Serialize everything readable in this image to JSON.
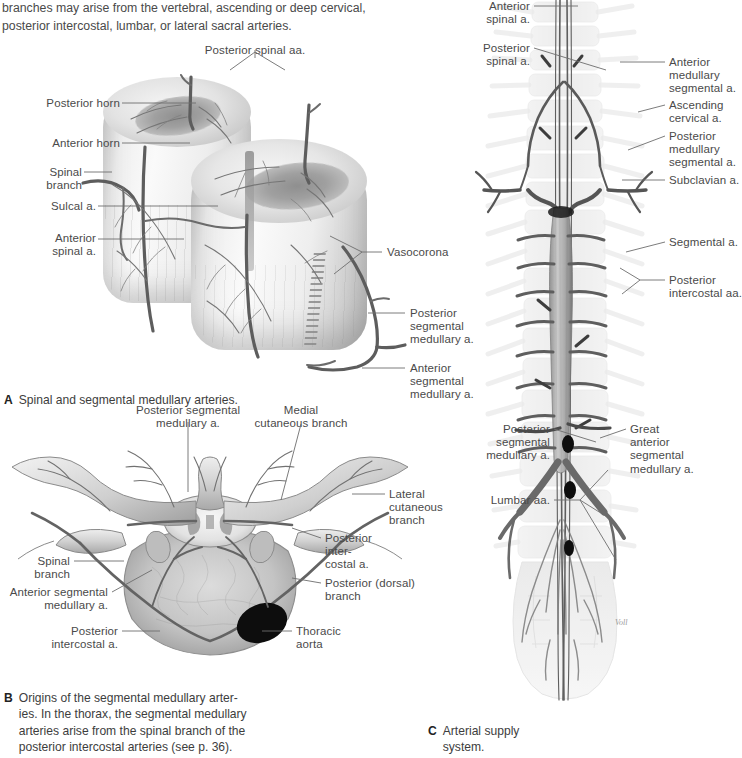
{
  "page": {
    "intro_text": "branches may arise from the vertebral, ascending or deep cervical,\nposterior intercostal, lumbar, or lateral sacral arteries."
  },
  "figure_a": {
    "letter": "A",
    "caption": "Spinal and segmental medullary arteries.",
    "labels": {
      "posterior_spinal_aa": "Posterior spinal aa.",
      "posterior_horn": "Posterior horn",
      "anterior_horn": "Anterior horn",
      "spinal_branch": "Spinal\nbranch",
      "sulcal_a": "Sulcal a.",
      "anterior_spinal_a": "Anterior\nspinal a.",
      "vasocorona": "Vasocorona",
      "posterior_segmental_medullary_a": "Posterior\nsegmental\nmedullary a.",
      "anterior_segmental_medullary_a": "Anterior\nsegmental\nmedullary a."
    }
  },
  "figure_b": {
    "letter": "B",
    "caption": "Origins of the segmental medullary arter-\nies. In the thorax, the segmental medullary\narteries arise from the spinal branch of the\nposterior intercostal arteries (see p. 36).",
    "labels": {
      "posterior_segmental_medullary_a": "Posterior segmental\nmedullary a.",
      "medial_cutaneous_branch": "Medial\ncutaneous branch",
      "lateral_cutaneous_branch": "Lateral\ncutaneous\nbranch",
      "posterior_intercostal_a": "Posterior\ninter-\ncostal a.",
      "posterior_dorsal_branch": "Posterior (dorsal)\nbranch",
      "spinal_branch": "Spinal\nbranch",
      "anterior_segmental_medullary_a": "Anterior segmental\nmedullary a.",
      "posterior_intercostal_a_left": "Posterior\nintercostal a.",
      "thoracic_aorta": "Thoracic\naorta"
    }
  },
  "figure_c": {
    "letter": "C",
    "caption": "Arterial supply\nsystem.",
    "labels": {
      "anterior_spinal_a": "Anterior\nspinal a.",
      "posterior_spinal_a": "Posterior\nspinal a.",
      "anterior_medullary_segmental_a": "Anterior\nmedullary\nsegmental a.",
      "ascending_cervical_a": "Ascending\ncervical a.",
      "posterior_medullary_segmental_a": "Posterior\nmedullary\nsegmental a.",
      "subclavian_a": "Subclavian a.",
      "segmental_a": "Segmental a.",
      "posterior_intercostal_aa": "Posterior\nintercostal aa.",
      "posterior_segmental_medullary_a": "Posterior\nsegmental\nmedullary a.",
      "great_anterior_segmental_medullary_a": "Great\nanterior\nsegmental\nmedullary a.",
      "lumbar_aa": "Lumbar aa."
    }
  },
  "colors": {
    "text": "#4a4a4a",
    "leader": "#6d6d6d",
    "vessel": "#6a6a6a",
    "aorta_dark": "#111111",
    "bone_light": "#e8e8e8"
  }
}
